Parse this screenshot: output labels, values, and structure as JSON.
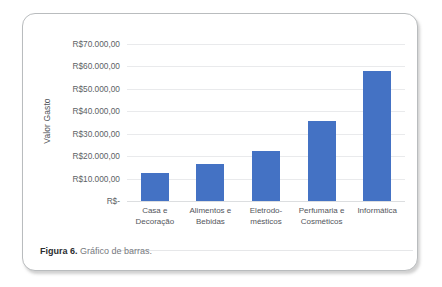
{
  "figure": {
    "caption_label": "Figura 6.",
    "caption_text": "Gráfico de barras."
  },
  "chart_data": {
    "type": "bar",
    "title": "",
    "xlabel": "",
    "ylabel": "Valor Gasto",
    "categories": [
      "Casa e Decoração",
      "Alimentos e Bebidas",
      "Eletrodomésticos",
      "Perfumaria e Cosméticos",
      "Informática"
    ],
    "category_lines": [
      [
        "Casa e",
        "Decoração"
      ],
      [
        "Alimentos e",
        "Bebidas"
      ],
      [
        "Eletrodo-",
        "mésticos"
      ],
      [
        "Perfumaria e",
        "Cosméticos"
      ],
      [
        "Informática"
      ]
    ],
    "values": [
      12500,
      16500,
      22500,
      35800,
      58000
    ],
    "ylim": [
      0,
      70000
    ],
    "yticks": [
      0,
      10000,
      20000,
      30000,
      40000,
      50000,
      60000,
      70000
    ],
    "ytick_labels": [
      "R$-",
      "R$10.000,00",
      "R$20.000,00",
      "R$30.000,00",
      "R$40.000,00",
      "R$50.000,00",
      "R$60.000,00",
      "R$70.000,00"
    ],
    "grid": true,
    "legend": false,
    "bar_color": "#4472C4",
    "gridline_color": "#E9EAEC"
  }
}
